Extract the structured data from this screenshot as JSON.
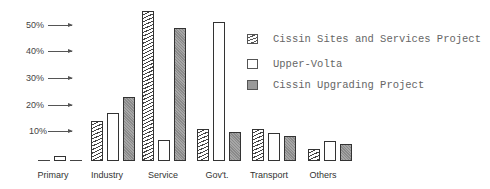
{
  "chart_data": {
    "type": "bar",
    "title": "",
    "xlabel": "",
    "ylabel": "",
    "ylim": [
      0,
      60
    ],
    "y_ticks": [
      "10%",
      "20%",
      "30%",
      "40%",
      "50%"
    ],
    "y_tick_values": [
      10,
      20,
      30,
      40,
      50
    ],
    "grid": false,
    "legend_position": "upper right",
    "categories": [
      "Primary",
      "Industry",
      "Service",
      "Gov't.",
      "Transport",
      "Others"
    ],
    "series": [
      {
        "name": "Cissin Sites and Services Project",
        "pattern": "hatched",
        "values": [
          0,
          15,
          56,
          12,
          12,
          4.5
        ]
      },
      {
        "name": "Upper-Volta",
        "pattern": "white",
        "values": [
          2,
          18,
          8,
          52,
          10.5,
          7.5
        ]
      },
      {
        "name": "Cissin Upgrading Project",
        "pattern": "gray",
        "values": [
          0,
          24,
          50,
          11,
          9.5,
          6.5
        ]
      }
    ]
  },
  "colors": {
    "hatch": "#444444",
    "white_bar": "#ffffff",
    "gray_bar": "#8a8a8a",
    "outline": "#333333",
    "legend_text": "#666666"
  }
}
